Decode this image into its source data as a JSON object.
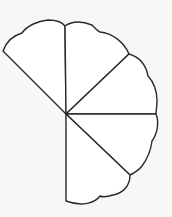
{
  "diagram": {
    "type": "scalloped-fan",
    "sector_count": 5,
    "colors": {
      "background": "#f7f7f7",
      "fill": "#ffffff",
      "stroke": "#2a2a2a"
    },
    "center": [
      66,
      114
    ],
    "sectors": [
      {
        "name": "upper-left",
        "path": "M66,114 L3,51 C6,42 12,36 22,33 C27,26 37,21 48,20 C55,20 62,22 65,26 Z"
      },
      {
        "name": "upper-middle",
        "path": "M66,114 L65,26 C72,21 82,21 92,25 C95,28 97,31 100,32 C112,33 124,42 129,54 Z"
      },
      {
        "name": "right-upper",
        "path": "M66,114 L129,54 C139,57 146,65 148,76 C154,82 157,92 157,100 C157,106 156,111 156,114 Z"
      },
      {
        "name": "right-lower",
        "path": "M66,114 L156,114 C159,121 158,133 152,141 C151,149 148,158 142,166 C139,170 134,173 130,175 Z"
      },
      {
        "name": "bottom",
        "path": "M66,114 L130,175 C130,185 124,193 113,195 C107,197 102,197 100,196 C95,203 82,207 66,201 Z"
      }
    ]
  }
}
